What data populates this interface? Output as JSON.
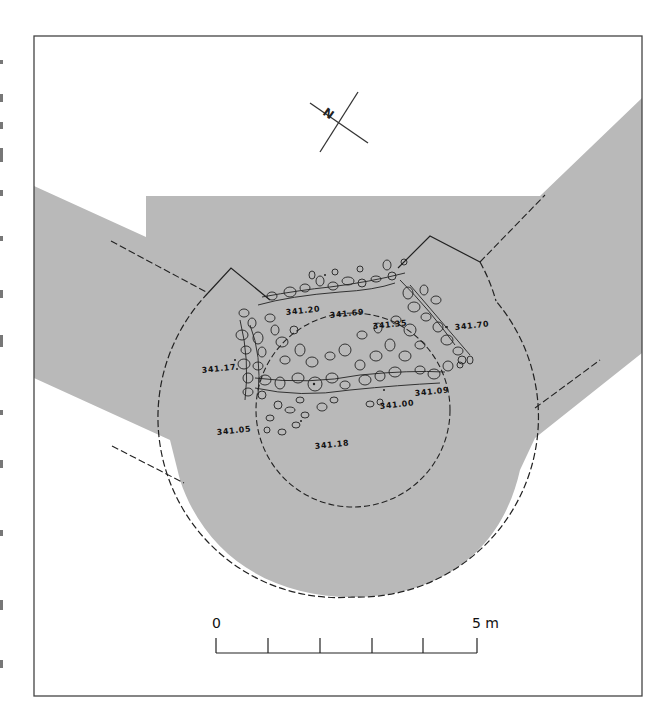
{
  "figure": {
    "type": "archaeological-excavation-plan",
    "fill_color": "#b9b9b9",
    "line_color": "#222222"
  },
  "north_arrow": {
    "label": "N"
  },
  "elevations": [
    {
      "id": "e1",
      "value": "341.20"
    },
    {
      "id": "e2",
      "value": "341.69"
    },
    {
      "id": "e3",
      "value": "341.35"
    },
    {
      "id": "e4",
      "value": "341.70"
    },
    {
      "id": "e5",
      "value": "341.17"
    },
    {
      "id": "e6",
      "value": "341.00"
    },
    {
      "id": "e7",
      "value": "341.09"
    },
    {
      "id": "e8",
      "value": "341.05"
    },
    {
      "id": "e9",
      "value": "341.18"
    }
  ],
  "scale_bar": {
    "start_label": "0",
    "end_label": "5 m",
    "divisions": 5
  }
}
